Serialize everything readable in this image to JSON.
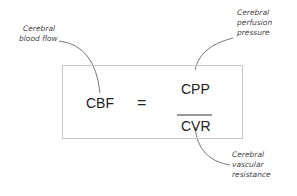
{
  "equation": {
    "lhs": "CBF",
    "operator": "=",
    "numerator": "CPP",
    "denominator": "CVR"
  },
  "annotations": {
    "cbf": [
      "Cerebral",
      "blood flow"
    ],
    "cpp": [
      "Cerebral",
      "perfusion",
      "pressure"
    ],
    "cvr": [
      "Cerebral",
      "vascular",
      "resistance"
    ]
  },
  "colors": {
    "text": "#222222",
    "label": "#444444",
    "box_border": "#c8c8c8",
    "leader_line": "#555555"
  }
}
